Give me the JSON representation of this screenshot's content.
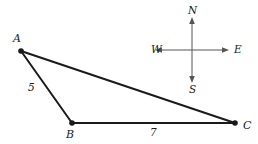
{
  "figure": {
    "type": "geometry-diagram",
    "background_color": "#ffffff",
    "stroke_color": "#1a1a1a",
    "compass_stroke_color": "#555555"
  },
  "triangle": {
    "vertices": [
      {
        "name": "A",
        "label": "A",
        "x": 21,
        "y": 51,
        "label_x": 13,
        "label_y": 33
      },
      {
        "name": "B",
        "label": "B",
        "x": 72,
        "y": 123,
        "label_x": 66,
        "label_y": 129
      },
      {
        "name": "C",
        "label": "C",
        "x": 235,
        "y": 123,
        "label_x": 243,
        "label_y": 120
      }
    ],
    "edges": [
      {
        "name": "AB",
        "from": "A",
        "to": "B",
        "length_label": "5",
        "label_x": 28,
        "label_y": 82
      },
      {
        "name": "BC",
        "from": "B",
        "to": "C",
        "length_label": "7",
        "label_x": 150,
        "label_y": 127
      },
      {
        "name": "AC",
        "from": "A",
        "to": "C",
        "length_label": "",
        "label_x": 0,
        "label_y": 0
      }
    ]
  },
  "compass": {
    "center_x": 192,
    "center_y": 50,
    "arm_length_vertical": 32,
    "arm_length_horizontal": 35,
    "directions": [
      {
        "name": "north",
        "label": "N",
        "label_x": 188,
        "label_y": 5
      },
      {
        "name": "south",
        "label": "S",
        "label_x": 189,
        "label_y": 84
      },
      {
        "name": "east",
        "label": "E",
        "label_x": 234,
        "label_y": 44
      },
      {
        "name": "west",
        "label": "W",
        "label_x": 151,
        "label_y": 44
      }
    ]
  }
}
